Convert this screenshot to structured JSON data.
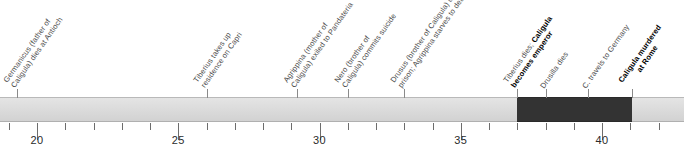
{
  "chart_data": {
    "type": "timeline",
    "title": "",
    "xlabel": "",
    "ylabel": "",
    "xlim": [
      17.5,
      43.5
    ],
    "axis": {
      "major_ticks": [
        20,
        25,
        30,
        35,
        40
      ],
      "major_tick_labels": [
        "20",
        "25",
        "30",
        "35",
        "40"
      ],
      "minor_tick_step": 1,
      "minor_ticks": [
        18,
        19,
        21,
        22,
        23,
        24,
        26,
        27,
        28,
        29,
        31,
        32,
        33,
        34,
        36,
        37,
        38,
        39,
        41,
        42,
        43
      ],
      "grid": false,
      "units": "AD (year)"
    },
    "bands": [
      {
        "name": "timeline-band",
        "start": 17.5,
        "end": 43.5,
        "color": "#dcdcdc",
        "emphasis": false
      },
      {
        "name": "caligula-reign",
        "start": 37.0,
        "end": 41.05,
        "color": "#333333",
        "emphasis": true
      }
    ],
    "events": [
      {
        "year": 19.3,
        "text": "Germanicus (father of Caligula) dies at Antioch",
        "bold": false
      },
      {
        "year": 26.0,
        "text": "Tiberius takes up residence on Capri",
        "bold": false
      },
      {
        "year": 29.2,
        "text": "Agrippina (mother of Caligula) exiled to Pandateria",
        "bold": false
      },
      {
        "year": 31.0,
        "text": "Nero (brother of Caligula) commits suicide",
        "bold": false
      },
      {
        "year": 33.0,
        "text": "Drusus (brother of Caligula) dies in prison; Agrippina starves to death",
        "bold": false
      },
      {
        "year": 37.0,
        "text": "Tiberius dies; Caligula becomes emperor",
        "bold": false,
        "bold_part": "Caligula becomes emperor",
        "plain_part": "Tiberius dies; "
      },
      {
        "year": 38.0,
        "text": "Drusilla dies",
        "bold": false
      },
      {
        "year": 39.5,
        "text": "C. travels to Germany",
        "bold": false
      },
      {
        "year": 41.05,
        "text": "Caligula murdered at Rome",
        "bold": true
      }
    ]
  }
}
